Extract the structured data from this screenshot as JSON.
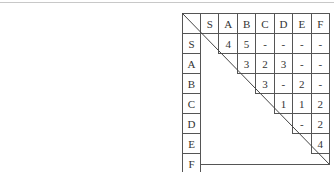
{
  "table": {
    "columns": [
      "S",
      "A",
      "B",
      "C",
      "D",
      "E",
      "F"
    ],
    "rows": [
      {
        "label": "S",
        "cells": [
          "",
          "4",
          "5",
          "-",
          "-",
          "-",
          "-"
        ]
      },
      {
        "label": "A",
        "cells": [
          "",
          "",
          "3",
          "2",
          "3",
          "-",
          "-"
        ]
      },
      {
        "label": "B",
        "cells": [
          "",
          "",
          "",
          "3",
          "-",
          "2",
          "-"
        ]
      },
      {
        "label": "C",
        "cells": [
          "",
          "",
          "",
          "",
          "1",
          "1",
          "2"
        ]
      },
      {
        "label": "D",
        "cells": [
          "",
          "",
          "",
          "",
          "",
          "-",
          "2"
        ]
      },
      {
        "label": "E",
        "cells": [
          "",
          "",
          "",
          "",
          "",
          "",
          "4"
        ]
      },
      {
        "label": "F",
        "cells": [
          "",
          "",
          "",
          "",
          "",
          "",
          ""
        ]
      }
    ]
  }
}
